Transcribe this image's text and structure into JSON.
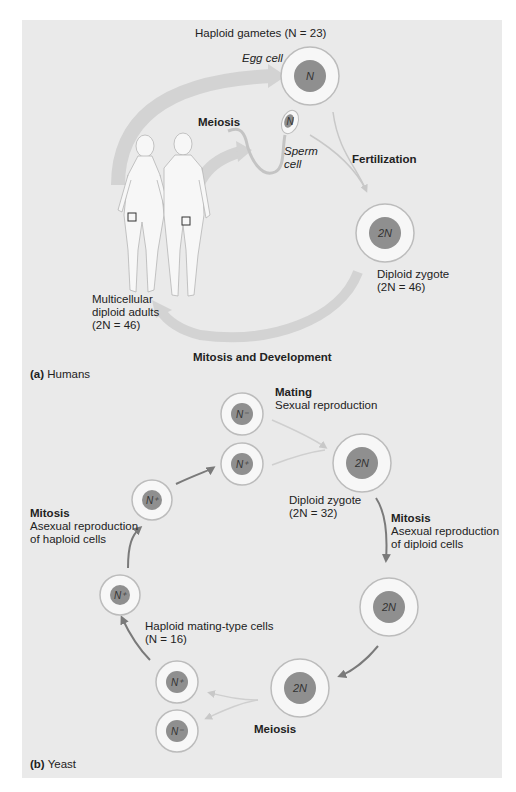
{
  "panel_a": {
    "caption_letter": "(a)",
    "caption_name": "Humans",
    "haploid_gametes": "Haploid gametes (N = 23)",
    "egg_cell": "Egg cell",
    "sperm_cell_line1": "Sperm",
    "sperm_cell_line2": "cell",
    "meiosis": "Meiosis",
    "fertilization": "Fertilization",
    "zygote_line1": "Diploid zygote",
    "zygote_line2": "(2N = 46)",
    "adults_line1": "Multicellular",
    "adults_line2": "diploid adults",
    "adults_line3": "(2N = 46)",
    "mitosis_development": "Mitosis and Development",
    "cells": {
      "egg": "N",
      "sperm": "N",
      "zygote": "2N"
    }
  },
  "panel_b": {
    "caption_letter": "(b)",
    "caption_name": "Yeast",
    "mating_title": "Mating",
    "mating_sub": "Sexual reproduction",
    "zygote_line1": "Diploid zygote",
    "zygote_line2": "(2N = 32)",
    "mitosis_right_title": "Mitosis",
    "mitosis_right_line1": "Asexual reproduction",
    "mitosis_right_line2": "of diploid cells",
    "mitosis_left_title": "Mitosis",
    "mitosis_left_line1": "Asexual reproduction",
    "mitosis_left_line2": "of haploid cells",
    "haploid_line1": "Haploid mating-type cells",
    "haploid_line2": "(N = 16)",
    "meiosis": "Meiosis",
    "cells": {
      "n_minus_top": "N⁻",
      "n_plus_top": "N⁺",
      "zygote": "2N",
      "n_plus_left_upper": "N⁺",
      "n_plus_left_lower": "N⁺",
      "diploid_right": "2N",
      "diploid_bottom": "2N",
      "n_plus_bottom": "N⁺",
      "n_minus_bottom": "N⁻"
    }
  },
  "colors": {
    "panel_bg": "#eaeaea",
    "nucleus": "#8f8f8f",
    "cell_ring": "#b9b9b9",
    "dark_arrow": "#7a7a7a",
    "light_arrow": "#cfcfcf"
  }
}
